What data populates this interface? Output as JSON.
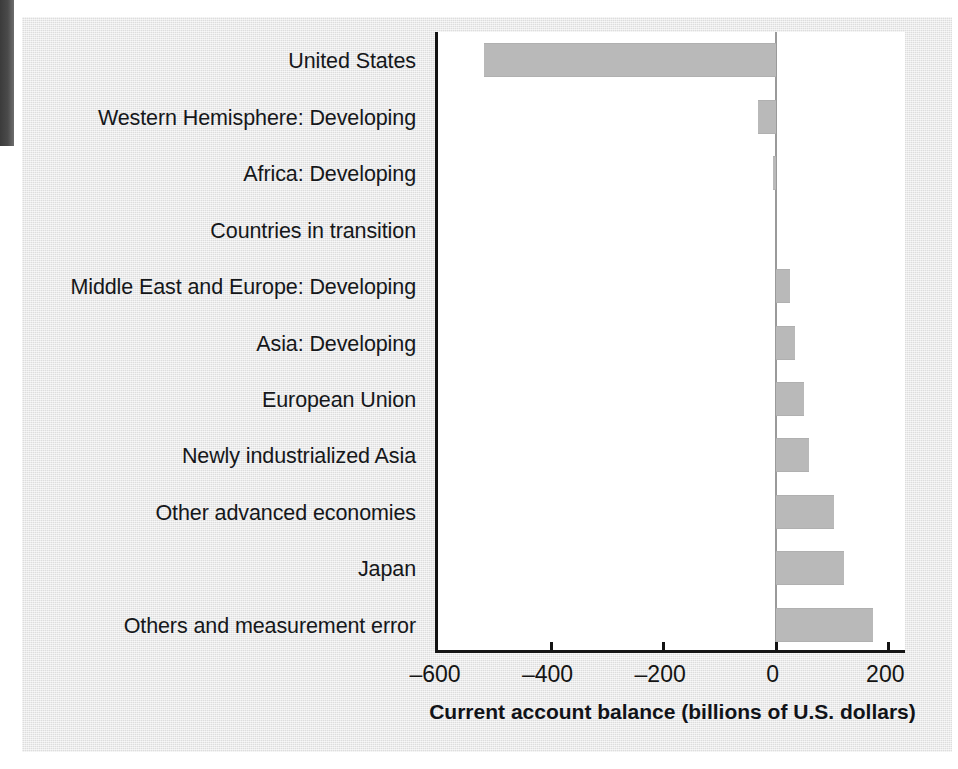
{
  "figure": {
    "axis_title": "Current account balance (billions of U.S. dollars)",
    "background_color": "#e7e7e7",
    "bar_color": "#b9b9b9",
    "axis_color": "#141414",
    "plot_background": "#ffffff"
  },
  "chart_data": {
    "type": "bar",
    "orientation": "horizontal",
    "title": "",
    "subtitle": "",
    "xlabel": "Current account balance (billions of U.S. dollars)",
    "ylabel": "",
    "xlim": [
      -600,
      235
    ],
    "ylim": null,
    "grid": false,
    "legend": null,
    "xticks": [
      -600,
      -400,
      -200,
      0,
      200
    ],
    "xtick_labels": [
      "–600",
      "–400",
      "–200",
      "0",
      "200"
    ],
    "categories": [
      "United States",
      "Western Hemisphere: Developing",
      "Africa: Developing",
      "Countries in transition",
      "Middle East and Europe: Developing",
      "Asia: Developing",
      "European Union",
      "Newly industrialized Asia",
      "Other advanced economies",
      "Japan",
      "Others and measurement error"
    ],
    "values": [
      -519,
      -32,
      -5,
      0,
      26,
      35,
      51,
      60,
      104,
      121,
      172
    ],
    "series": [
      {
        "name": "Current account balance",
        "values": [
          -519,
          -32,
          -5,
          0,
          26,
          35,
          51,
          60,
          104,
          121,
          172
        ]
      }
    ],
    "annotations": []
  }
}
